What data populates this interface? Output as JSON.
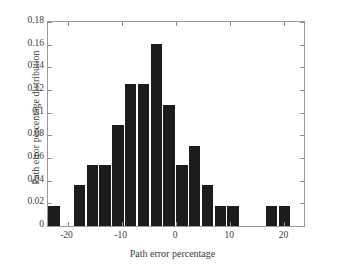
{
  "figure": {
    "background": "#ffffff",
    "bar_color": "#1c1c1c",
    "axis_color": "#9a9a9a"
  },
  "chart_data": {
    "type": "bar",
    "title": "",
    "subtitle": "",
    "xlabel": "Path error percentage",
    "ylabel": "Path error percentage distribution",
    "xlim": [
      -23.6,
      23.6
    ],
    "ylim": [
      0,
      0.18
    ],
    "grid": false,
    "legend": null,
    "bin_width": 2.36,
    "xticks": [
      -20,
      -10,
      0,
      10,
      20
    ],
    "xtick_labels": [
      "-20",
      "-10",
      "0",
      "10",
      "20"
    ],
    "yticks": [
      0,
      0.02,
      0.04,
      0.06,
      0.08,
      0.1,
      0.12,
      0.14,
      0.16,
      0.18
    ],
    "ytick_labels": [
      "0",
      "0.02",
      "0.04",
      "0.06",
      "0.08",
      "0.1",
      "0.12",
      "0.14",
      "0.16",
      "0.18"
    ],
    "bin_centers": [
      -22.4,
      -20.1,
      -17.7,
      -15.3,
      -13.0,
      -10.6,
      -8.3,
      -5.9,
      -3.5,
      -1.2,
      1.2,
      3.5,
      5.9,
      8.3,
      10.6,
      13.0,
      15.3,
      17.7,
      20.1,
      22.4
    ],
    "values": [
      0.018,
      0.0,
      0.036,
      0.054,
      0.054,
      0.089,
      0.125,
      0.125,
      0.161,
      0.107,
      0.054,
      0.071,
      0.036,
      0.018,
      0.018,
      0.0,
      0.0,
      0.018,
      0.018,
      0.0
    ],
    "categories": [
      "-22.4",
      "-20.1",
      "-17.7",
      "-15.3",
      "-13.0",
      "-10.6",
      "-8.3",
      "-5.9",
      "-3.5",
      "-1.2",
      "1.2",
      "3.5",
      "5.9",
      "8.3",
      "10.6",
      "13.0",
      "15.3",
      "17.7",
      "20.1",
      "22.4"
    ]
  }
}
